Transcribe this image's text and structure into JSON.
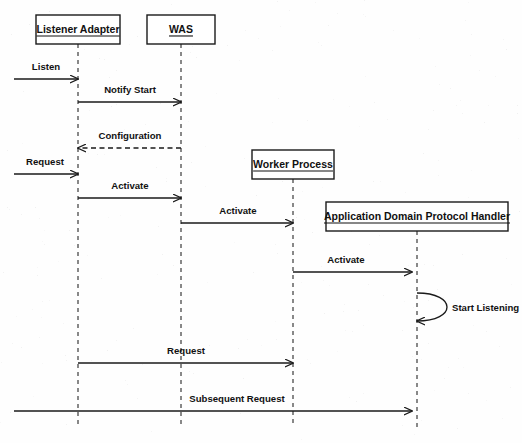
{
  "diagram": {
    "type": "uml-sequence-diagram",
    "canvas": {
      "width": 522,
      "height": 443
    },
    "colors": {
      "background": "#fefefe",
      "stroke": "#1a1a1a",
      "lifeline": "#3a3a3a",
      "text": "#111111"
    },
    "participants": [
      {
        "id": "listener-adapter",
        "label": "Listener Adapter",
        "box": {
          "x": 36,
          "y": 15,
          "width": 84,
          "height": 29
        },
        "lifeline_x": 78,
        "lifeline_top": 44,
        "lifeline_bottom": 427
      },
      {
        "id": "was",
        "label": "WAS",
        "box": {
          "x": 147,
          "y": 15,
          "width": 68,
          "height": 29
        },
        "lifeline_x": 181,
        "lifeline_top": 44,
        "lifeline_bottom": 427
      },
      {
        "id": "worker-process",
        "label": "Worker Process",
        "box": {
          "x": 252,
          "y": 150,
          "width": 82,
          "height": 29
        },
        "lifeline_x": 293,
        "lifeline_top": 179,
        "lifeline_bottom": 427
      },
      {
        "id": "application-domain-protocol-handler",
        "label": "Application Domain Protocol Handler",
        "box": {
          "x": 326,
          "y": 202,
          "width": 182,
          "height": 29
        },
        "lifeline_x": 417,
        "lifeline_top": 231,
        "lifeline_bottom": 427
      }
    ],
    "messages": [
      {
        "id": "msg-listen",
        "label": "Listen",
        "from_x": 14,
        "to_x": 78,
        "y": 79,
        "style": "solid",
        "direction": "right",
        "label_x": 46,
        "label_y": 70,
        "origin": "external",
        "target": "listener-adapter"
      },
      {
        "id": "msg-notify-start",
        "label": "Notify Start",
        "from_x": 78,
        "to_x": 181,
        "y": 102,
        "style": "solid",
        "direction": "right",
        "label_x": 130,
        "label_y": 93,
        "origin": "listener-adapter",
        "target": "was"
      },
      {
        "id": "msg-configuration",
        "label": "Configuration",
        "from_x": 181,
        "to_x": 78,
        "y": 148,
        "style": "dashed",
        "direction": "left",
        "label_x": 130,
        "label_y": 139,
        "origin": "was",
        "target": "listener-adapter"
      },
      {
        "id": "msg-request-1",
        "label": "Request",
        "from_x": 14,
        "to_x": 78,
        "y": 174,
        "style": "solid",
        "direction": "right",
        "label_x": 45,
        "label_y": 165,
        "origin": "external",
        "target": "listener-adapter"
      },
      {
        "id": "msg-activate-1",
        "label": "Activate",
        "from_x": 78,
        "to_x": 181,
        "y": 198,
        "style": "solid",
        "direction": "right",
        "label_x": 130,
        "label_y": 189,
        "origin": "listener-adapter",
        "target": "was"
      },
      {
        "id": "msg-activate-2",
        "label": "Activate",
        "from_x": 181,
        "to_x": 293,
        "y": 223,
        "style": "solid",
        "direction": "right",
        "label_x": 238,
        "label_y": 214,
        "origin": "was",
        "target": "worker-process"
      },
      {
        "id": "msg-activate-3",
        "label": "Activate",
        "from_x": 293,
        "to_x": 412,
        "y": 272,
        "style": "solid",
        "direction": "right",
        "label_x": 346,
        "label_y": 263,
        "origin": "worker-process",
        "target": "application-domain-protocol-handler"
      },
      {
        "id": "msg-request-2",
        "label": "Request",
        "from_x": 78,
        "to_x": 293,
        "y": 363,
        "style": "solid",
        "direction": "right",
        "label_x": 186,
        "label_y": 354,
        "origin": "listener-adapter",
        "target": "worker-process"
      },
      {
        "id": "msg-subsequent-request",
        "label": "Subsequent Request",
        "from_x": 14,
        "to_x": 412,
        "y": 411,
        "style": "solid",
        "direction": "right",
        "label_x": 237,
        "label_y": 402,
        "origin": "external",
        "target": "application-domain-protocol-handler"
      }
    ],
    "self_messages": [
      {
        "id": "self-start-listening",
        "label": "Start Listening",
        "lifeline_x": 417,
        "start_y": 293,
        "end_y": 321,
        "extent_x": 448,
        "label_x": 452,
        "label_y": 311,
        "on": "application-domain-protocol-handler"
      }
    ]
  }
}
